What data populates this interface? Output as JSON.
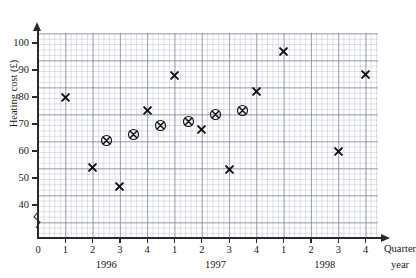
{
  "chart_data": {
    "type": "scatter",
    "title": "",
    "xlabel_primary": "Quarter",
    "xlabel_secondary": "year",
    "ylabel": "Heating cost (£)",
    "ylim": [
      36,
      104
    ],
    "y_ticks": [
      40,
      50,
      60,
      70,
      80,
      90,
      100
    ],
    "y_axis_break": true,
    "y_origin_label": "0",
    "grid": true,
    "legend": "none",
    "x_ticks": [
      "0",
      "1",
      "2",
      "3",
      "4",
      "1",
      "2",
      "3",
      "4",
      "1",
      "2",
      "3",
      "4"
    ],
    "x_group_labels": [
      "1996",
      "1997",
      "1998"
    ],
    "series": [
      {
        "name": "Heating cost",
        "marker": "cross",
        "points": [
          {
            "x": 1,
            "label": "1996 Q1",
            "y": 80
          },
          {
            "x": 2,
            "label": "1996 Q2",
            "y": 54
          },
          {
            "x": 3,
            "label": "1996 Q3",
            "y": 47
          },
          {
            "x": 4,
            "label": "1996 Q4",
            "y": 75
          },
          {
            "x": 5,
            "label": "1997 Q1",
            "y": 88
          },
          {
            "x": 6,
            "label": "1997 Q2",
            "y": 68
          },
          {
            "x": 7,
            "label": "1997 Q3",
            "y": 53
          },
          {
            "x": 8,
            "label": "1997 Q4",
            "y": 82
          },
          {
            "x": 9,
            "label": "1998 Q1",
            "y": 97
          },
          {
            "x": 11,
            "label": "1998 Q3",
            "y": 60
          },
          {
            "x": 12,
            "label": "1998 Q4",
            "y": 88.5
          }
        ]
      },
      {
        "name": "4-point moving average",
        "marker": "circled-cross",
        "points": [
          {
            "x": 2.5,
            "label": "1996 Q2-Q3",
            "y": 64
          },
          {
            "x": 3.5,
            "label": "1996 Q3-Q4",
            "y": 66
          },
          {
            "x": 4.5,
            "label": "1996 Q4 - 1997 Q1",
            "y": 69.5
          },
          {
            "x": 5.5,
            "label": "1997 Q1-Q2",
            "y": 71
          },
          {
            "x": 6.5,
            "label": "1997 Q2-Q3",
            "y": 73.5
          },
          {
            "x": 7.5,
            "label": "1997 Q3-Q4",
            "y": 75
          }
        ]
      }
    ]
  }
}
